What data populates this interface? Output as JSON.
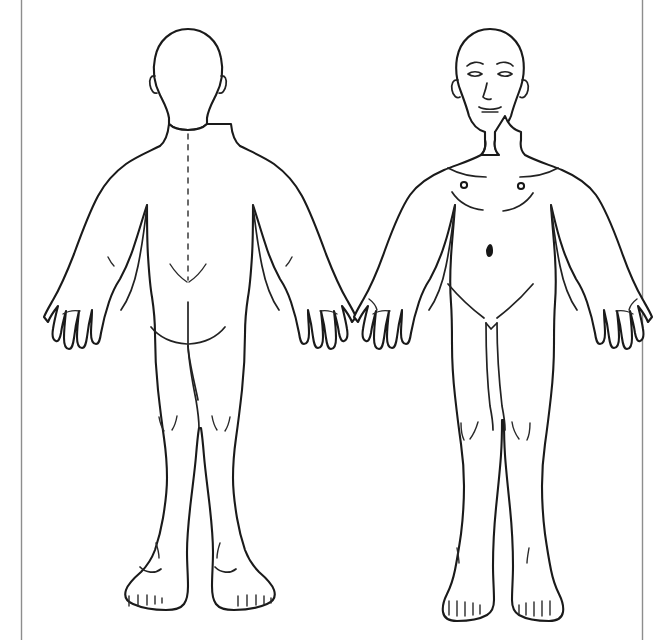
{
  "page": {
    "title": "Human Body Diagram",
    "description": "Two full-body line-art outlines of a male figure on a plain white sheet: posterior (back) view on the left and anterior (front) view on the right.",
    "background_color": "#ffffff",
    "line_color": "#1a1a1a",
    "frame_color": "#8d8d8d",
    "width": 665,
    "height": 640
  },
  "frame": {
    "left_rule_label": "left margin rule",
    "right_rule_label": "right margin rule",
    "left_rule_x": 21,
    "right_rule_x": 642
  },
  "figures": [
    {
      "id": "posterior",
      "view_label": "Posterior view",
      "orientation": "back",
      "center_x": 188,
      "features": [
        "head-outline-back",
        "left-ear",
        "right-ear",
        "neck",
        "shoulders",
        "spine-midline",
        "sacral-dimples",
        "gluteal-fold",
        "gluteal-cleft",
        "left-arm",
        "right-arm",
        "left-hand-dorsum",
        "right-hand-dorsum",
        "left-popliteal-fossa",
        "right-popliteal-fossa",
        "left-heel",
        "right-heel",
        "toes-from-behind"
      ]
    },
    {
      "id": "anterior",
      "view_label": "Anterior view",
      "orientation": "front",
      "center_x": 490,
      "features": [
        "head-outline-front",
        "left-eyebrow",
        "right-eyebrow",
        "left-eye",
        "right-eye",
        "nose",
        "mouth",
        "left-ear",
        "right-ear",
        "neck",
        "clavicles",
        "left-nipple",
        "right-nipple",
        "left-pectoral-crease",
        "right-pectoral-crease",
        "navel",
        "left-inguinal-crease",
        "right-inguinal-crease",
        "left-arm",
        "right-arm",
        "left-hand-palm",
        "right-hand-palm",
        "left-knee",
        "right-knee",
        "left-foot-toes",
        "right-foot-toes"
      ]
    }
  ]
}
